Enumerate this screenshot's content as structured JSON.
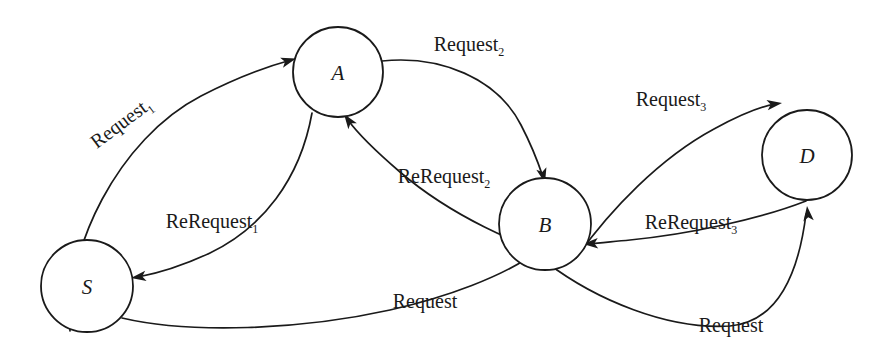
{
  "diagram": {
    "background_color": "#ffffff",
    "stroke_color": "#1a1a1a",
    "width": 880,
    "height": 360,
    "nodes": [
      {
        "id": "S",
        "label": "S",
        "cx": 87,
        "cy": 286,
        "r": 46
      },
      {
        "id": "A",
        "label": "A",
        "cx": 338,
        "cy": 72,
        "r": 45
      },
      {
        "id": "B",
        "label": "B",
        "cx": 545,
        "cy": 224,
        "r": 46
      },
      {
        "id": "D",
        "label": "D",
        "cx": 807,
        "cy": 155,
        "r": 45
      }
    ],
    "edges": [
      {
        "id": "s-to-a-request1",
        "from": "S",
        "to": "A",
        "label": "Request",
        "subscript": "1",
        "label_x": 125,
        "label_y": 128,
        "label_rotation": -37,
        "path": "M 70 331 C 64 250 118 139 201 96 C 240 76 269 66 291 60",
        "arrow_x": 296,
        "arrow_y": 58.5,
        "arrow_angle": -16
      },
      {
        "id": "a-to-s-rerequest1",
        "from": "A",
        "to": "S",
        "label": "ReRequest",
        "subscript": "1",
        "label_x": 212,
        "label_y": 228,
        "label_rotation": 0,
        "path": "M 312 113 C 300 180 262 228 210 253 C 182 266 159 273 138 277",
        "arrow_x": 131,
        "arrow_y": 278,
        "arrow_angle": 172
      },
      {
        "id": "s-to-b-request",
        "from": "S",
        "to": "B",
        "label": "Request",
        "subscript": "",
        "label_x": 425,
        "label_y": 308,
        "label_rotation": 0,
        "path": "M 122 318 C 190 334 300 330 390 310 C 452 296 500 276 528 258",
        "arrow_x": 534,
        "arrow_y": 254,
        "arrow_angle": -33
      },
      {
        "id": "a-to-b-request2",
        "from": "A",
        "to": "B",
        "label": "Request",
        "subscript": "2",
        "label_x": 469,
        "label_y": 51,
        "label_rotation": 0,
        "path": "M 382 61 C 440 55 497 78 521 125 C 534 150 540 168 543 177",
        "arrow_x": 545,
        "arrow_y": 183,
        "arrow_angle": 76
      },
      {
        "id": "b-to-a-rerequest2",
        "from": "B",
        "to": "A",
        "label": "ReRequest",
        "subscript": "2",
        "label_x": 444,
        "label_y": 183,
        "label_rotation": 0,
        "path": "M 566 258 C 520 247 450 215 400 172 C 372 148 356 131 348 120",
        "arrow_x": 344,
        "arrow_y": 114,
        "arrow_angle": -125
      },
      {
        "id": "b-to-d-request3",
        "from": "B",
        "to": "D",
        "label": "Request",
        "subscript": "3",
        "label_x": 671,
        "label_y": 106,
        "label_rotation": 0,
        "path": "M 576 258 C 610 210 660 158 714 129 C 745 112 764 106 775 104",
        "arrow_x": 782,
        "arrow_y": 103,
        "arrow_angle": -8
      },
      {
        "id": "d-to-b-rerequest3",
        "from": "D",
        "to": "B",
        "label": "ReRequest",
        "subscript": "3",
        "label_x": 691,
        "label_y": 229,
        "label_rotation": 0,
        "path": "M 806 201 C 760 219 690 234 630 240 C 610 242 598 243 590 244",
        "arrow_x": 583,
        "arrow_y": 244,
        "arrow_angle": 177
      },
      {
        "id": "b-to-d-request-bottom",
        "from": "B",
        "to": "D",
        "label": "Request",
        "subscript": "",
        "label_x": 731,
        "label_y": 332,
        "label_rotation": 0,
        "path": "M 546 262 C 596 300 668 330 730 326 C 775 322 798 278 806 214",
        "arrow_x": 807,
        "arrow_y": 206,
        "arrow_angle": -96
      }
    ]
  }
}
